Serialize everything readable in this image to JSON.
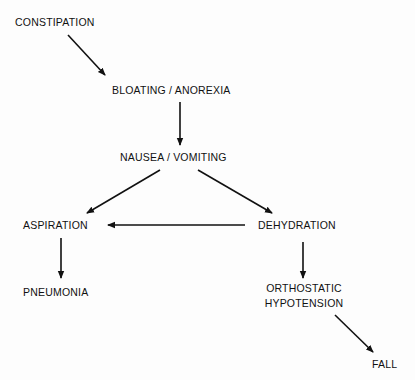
{
  "diagram": {
    "type": "flowchart",
    "nodes": {
      "constipation": "CONSTIPATION",
      "bloating": "BLOATING / ANOREXIA",
      "nausea": "NAUSEA / VOMITING",
      "aspiration": "ASPIRATION",
      "dehydration": "DEHYDRATION",
      "pneumonia": "PNEUMONIA",
      "orthostatic_line1": "ORTHOSTATIC",
      "orthostatic_line2": "HYPOTENSION",
      "fall": "FALL"
    },
    "edges": [
      {
        "from": "CONSTIPATION",
        "to": "BLOATING / ANOREXIA"
      },
      {
        "from": "BLOATING / ANOREXIA",
        "to": "NAUSEA / VOMITING"
      },
      {
        "from": "NAUSEA / VOMITING",
        "to": "ASPIRATION"
      },
      {
        "from": "NAUSEA / VOMITING",
        "to": "DEHYDRATION"
      },
      {
        "from": "DEHYDRATION",
        "to": "ASPIRATION"
      },
      {
        "from": "ASPIRATION",
        "to": "PNEUMONIA"
      },
      {
        "from": "DEHYDRATION",
        "to": "ORTHOSTATIC HYPOTENSION"
      },
      {
        "from": "ORTHOSTATIC HYPOTENSION",
        "to": "FALL"
      }
    ],
    "colors": {
      "line": "#111111",
      "text": "#111111",
      "background": "#fdfdfd"
    }
  }
}
